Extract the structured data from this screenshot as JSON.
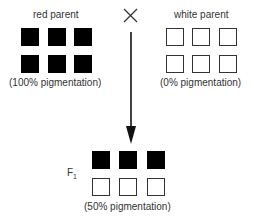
{
  "diagram": {
    "cross_symbol": "×",
    "red_parent": {
      "label": "red parent",
      "caption": "(100% pigmentation)",
      "squares": [
        "filled",
        "filled",
        "filled",
        "filled",
        "filled",
        "filled"
      ]
    },
    "white_parent": {
      "label": "white parent",
      "caption": "(0% pigmentation)",
      "squares": [
        "empty",
        "empty",
        "empty",
        "empty",
        "empty",
        "empty"
      ]
    },
    "f1": {
      "label": "F",
      "subscript": "1",
      "caption": "(50% pigmentation)",
      "squares": [
        "filled",
        "filled",
        "filled",
        "empty",
        "empty",
        "empty"
      ]
    },
    "colors": {
      "filled": "#000000",
      "empty": "#ffffff",
      "outline": "#333333"
    }
  }
}
